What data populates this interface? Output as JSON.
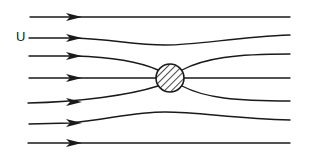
{
  "diagram": {
    "free_stream_label": "U",
    "stroke_color": "#1a1a1a",
    "background": "#ffffff",
    "cylinder": {
      "cx": 170,
      "cy": 78,
      "r": 14,
      "fill": "hatched"
    },
    "streamlines": [
      {
        "id": 1,
        "y_left": 17,
        "y_right": 17
      },
      {
        "id": 2,
        "y_left": 38,
        "y_right": 35
      },
      {
        "id": 3,
        "y_left": 56,
        "y_right": 54
      },
      {
        "id": 4,
        "y_left": 78,
        "y_right": 78
      },
      {
        "id": 5,
        "y_left": 102,
        "y_right": 101
      },
      {
        "id": 6,
        "y_left": 124,
        "y_right": 120
      },
      {
        "id": 7,
        "y_left": 143,
        "y_right": 143
      }
    ]
  }
}
